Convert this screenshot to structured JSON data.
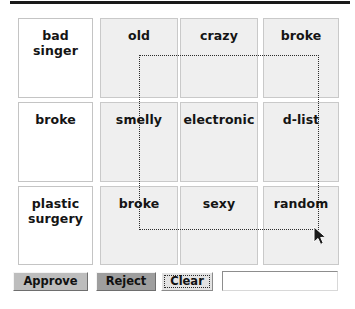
{
  "app": {
    "title": "Image Tagging Review Grid",
    "background_color": "#ffffff"
  },
  "grid": {
    "rows": 3,
    "columns": 4,
    "cells": [
      {
        "label": "bad singer",
        "style": "white",
        "row": 0,
        "col": 0
      },
      {
        "label": "old",
        "style": "gray",
        "row": 0,
        "col": 1
      },
      {
        "label": "crazy",
        "style": "gray",
        "row": 0,
        "col": 2
      },
      {
        "label": "broke",
        "style": "gray",
        "row": 0,
        "col": 3
      },
      {
        "label": "broke",
        "style": "white",
        "row": 1,
        "col": 0
      },
      {
        "label": "smelly",
        "style": "gray",
        "row": 1,
        "col": 1
      },
      {
        "label": "electronic",
        "style": "gray",
        "row": 1,
        "col": 2
      },
      {
        "label": "d-list",
        "style": "gray",
        "row": 1,
        "col": 3
      },
      {
        "label": "plastic surgery",
        "style": "white",
        "row": 2,
        "col": 0
      },
      {
        "label": "broke",
        "style": "gray",
        "row": 2,
        "col": 1
      },
      {
        "label": "sexy",
        "style": "gray",
        "row": 2,
        "col": 2
      },
      {
        "label": "random",
        "style": "gray",
        "row": 2,
        "col": 3
      }
    ]
  },
  "selection": {
    "kind": "dotted-marquee",
    "x": 139,
    "y": 55,
    "width": 180,
    "height": 175,
    "color": "#2b2b2b"
  },
  "cursor": {
    "kind": "arrow-pointer",
    "x": 315,
    "y": 228
  },
  "toolbar": {
    "approve_label": "Approve",
    "reject_label": "Reject",
    "clear_label": "Clear",
    "input_value": "",
    "input_placeholder": "",
    "approve_color": "#bdbdbd",
    "reject_color": "#9e9e9e",
    "clear_color": "#e3e3e3"
  }
}
